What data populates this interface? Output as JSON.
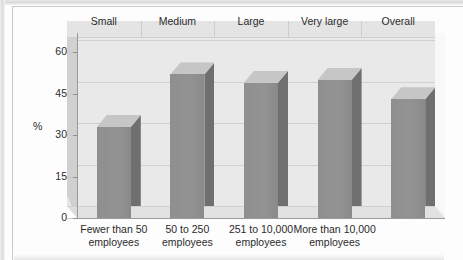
{
  "figure": {
    "y_axis_label": "%",
    "group_headers": [
      "Small",
      "Medium",
      "Large",
      "Very large",
      "Overall"
    ],
    "y_ticks": [
      "0",
      "15",
      "30",
      "45",
      "60"
    ],
    "x_labels": [
      {
        "line1": "Fewer than 50",
        "line2": "employees"
      },
      {
        "line1": "50 to 250",
        "line2": "employees"
      },
      {
        "line1": "251 to 10,000",
        "line2": "employees"
      },
      {
        "line1": "More than 10,000",
        "line2": "employees"
      },
      {
        "line1": "",
        "line2": ""
      }
    ],
    "colors": {
      "bar_front": "#8f8f8f",
      "bar_side": "#6f6f6f",
      "bar_top": "#c6c6c6",
      "plot_back_wall": "#e7e7e7",
      "plot_floor": "#dcdcdc",
      "gridline": "#d0d0d0",
      "axis": "#9a9a9a",
      "text": "#2b2b2b",
      "page_background": "#fdfdfd"
    }
  },
  "chart_data": {
    "type": "bar",
    "title": "",
    "subtitle": "",
    "xlabel": "",
    "ylabel": "%",
    "ylim": [
      0,
      67
    ],
    "yticks": [
      0,
      15,
      30,
      45,
      60
    ],
    "grid": true,
    "legend": "none",
    "style": "3d-column",
    "group_headers": [
      "Small",
      "Medium",
      "Large",
      "Very large",
      "Overall"
    ],
    "categories": [
      "Fewer than 50 employees",
      "50 to 250 employees",
      "251 to 10,000 employees",
      "More than 10,000 employees",
      "Overall"
    ],
    "values": [
      33,
      52,
      49,
      50,
      43
    ],
    "series": [
      {
        "name": "",
        "values": [
          33,
          52,
          49,
          50,
          43
        ]
      }
    ]
  }
}
